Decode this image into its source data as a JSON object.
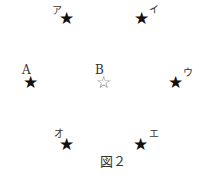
{
  "figure": {
    "caption": "図２",
    "stars": [
      {
        "id": "a",
        "label": "ア",
        "type": "filled"
      },
      {
        "id": "i",
        "label": "イ",
        "type": "filled"
      },
      {
        "id": "A",
        "label": "A",
        "type": "filled"
      },
      {
        "id": "B",
        "label": "B",
        "type": "outline"
      },
      {
        "id": "u",
        "label": "ウ",
        "type": "filled"
      },
      {
        "id": "o",
        "label": "オ",
        "type": "filled"
      },
      {
        "id": "e",
        "label": "エ",
        "type": "filled"
      }
    ],
    "glyphs": {
      "filled": "★",
      "outline": "☆"
    }
  }
}
